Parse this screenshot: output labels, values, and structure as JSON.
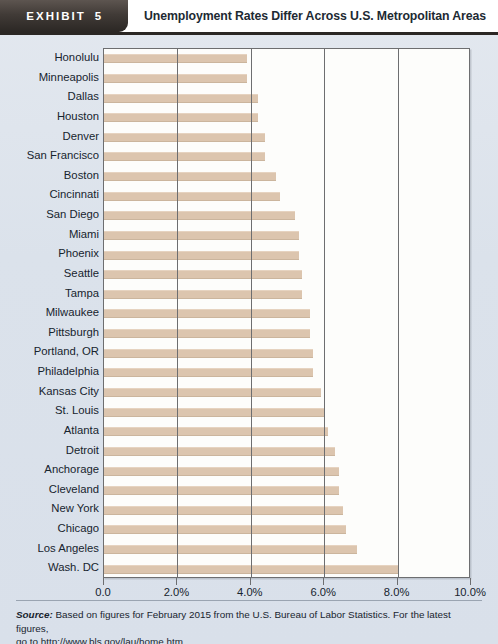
{
  "header": {
    "exhibit_label": "EXHIBIT",
    "exhibit_number": "5",
    "title": "Unemployment Rates Differ Across U.S. Metropolitan Areas"
  },
  "footer": {
    "source_label": "Source:",
    "source_text": " Based on figures for February 2015 from the U.S. Bureau of Labor Statistics. For the latest figures,",
    "source_line2": "go to http://www.bls.gov/lau/home.htm"
  },
  "chart_data": {
    "type": "bar",
    "orientation": "horizontal",
    "title": "Unemployment Rates Differ Across U.S. Metropolitan Areas",
    "xlabel": "",
    "ylabel": "",
    "xlim": [
      0.0,
      10.0
    ],
    "grid": true,
    "legend": null,
    "tick_labels": [
      "0.0",
      "2.0%",
      "4.0%",
      "6.0%",
      "8.0%",
      "10.0%"
    ],
    "tick_values": [
      0.0,
      2.0,
      4.0,
      6.0,
      8.0,
      10.0
    ],
    "categories": [
      "Honolulu",
      "Minneapolis",
      "Dallas",
      "Houston",
      "Denver",
      "San Francisco",
      "Boston",
      "Cincinnati",
      "San Diego",
      "Miami",
      "Phoenix",
      "Seattle",
      "Tampa",
      "Milwaukee",
      "Pittsburgh",
      "Portland, OR",
      "Philadelphia",
      "Kansas City",
      "St. Louis",
      "Atlanta",
      "Detroit",
      "Anchorage",
      "Cleveland",
      "New York",
      "Chicago",
      "Los Angeles",
      "Wash. DC"
    ],
    "values": [
      3.9,
      3.9,
      4.2,
      4.2,
      4.4,
      4.4,
      4.7,
      4.8,
      5.2,
      5.3,
      5.3,
      5.4,
      5.4,
      5.6,
      5.6,
      5.7,
      5.7,
      5.9,
      6.0,
      6.1,
      6.3,
      6.4,
      6.4,
      6.5,
      6.6,
      6.9,
      8.0
    ]
  },
  "colors": {
    "bar": "#dcc5ae",
    "plot_background": "#fdfdfb",
    "page_background": "#dfe5ed",
    "axis": "#6d6e70",
    "badge": "#2b2724",
    "text": "#17242e"
  }
}
